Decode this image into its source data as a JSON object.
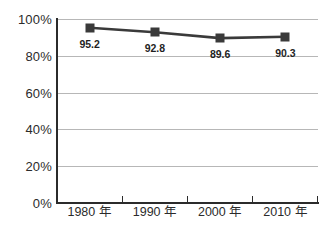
{
  "chart_data": {
    "type": "line",
    "title": "",
    "subtitle": "",
    "xlabel": "",
    "ylabel": "",
    "categories": [
      "1980 年",
      "1990 年",
      "2000 年",
      "2010 年"
    ],
    "values": [
      95.2,
      92.8,
      89.6,
      90.3
    ],
    "point_labels": [
      "95.2",
      "92.8",
      "89.6",
      "90.3"
    ],
    "series": [
      {
        "name": "",
        "values": [
          95.2,
          92.8,
          89.6,
          90.3
        ]
      }
    ],
    "ylim": [
      0,
      100
    ],
    "yticks": [
      0,
      20,
      40,
      60,
      80,
      100
    ],
    "ytick_labels": [
      "0%",
      "20%",
      "40%",
      "60%",
      "80%",
      "100%"
    ],
    "grid": true,
    "grid_axis": "y",
    "legend": false,
    "legend_position": "none",
    "colors": {
      "line": "#3a3a3a",
      "marker": "#3a3a3a",
      "axis": "#2b2b2b",
      "gridline": "#b7b7b7",
      "background": "#ffffff",
      "label_text": "#1f1f1f"
    },
    "marker_style": "square"
  }
}
